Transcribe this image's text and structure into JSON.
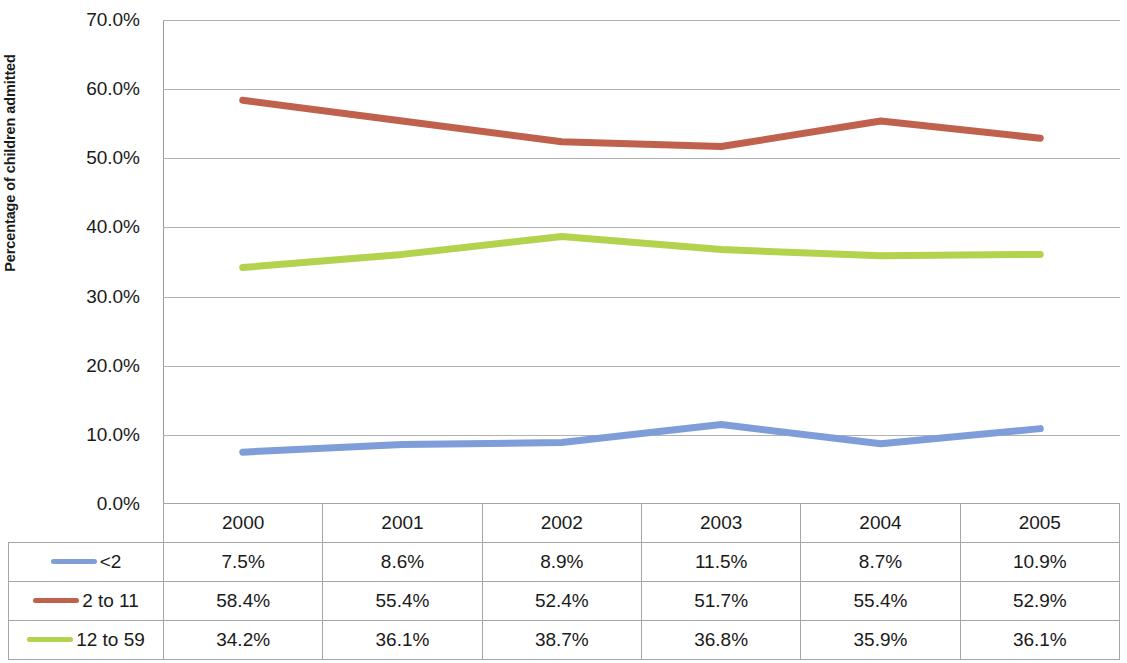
{
  "chart_data": {
    "type": "line",
    "title": "",
    "xlabel": "",
    "ylabel": "Percentage of children admitted",
    "categories": [
      "2000",
      "2001",
      "2002",
      "2003",
      "2004",
      "2005"
    ],
    "ylim": [
      0,
      70
    ],
    "ytick_labels": [
      "70.0%",
      "60.0%",
      "50.0%",
      "40.0%",
      "30.0%",
      "20.0%",
      "10.0%",
      "0.0%"
    ],
    "ytick_values": [
      70,
      60,
      50,
      40,
      30,
      20,
      10,
      0
    ],
    "grid": true,
    "legend_position": "data-table-left",
    "data_table_visible": true,
    "series": [
      {
        "name": "<2",
        "color": "#7f9dd9",
        "values": [
          7.5,
          8.6,
          8.9,
          11.5,
          8.7,
          10.9
        ],
        "labels": [
          "7.5%",
          "8.6%",
          "8.9%",
          "11.5%",
          "8.7%",
          "10.9%"
        ]
      },
      {
        "name": "2 to 11",
        "color": "#c0614e",
        "values": [
          58.4,
          55.4,
          52.4,
          51.7,
          55.4,
          52.9
        ],
        "labels": [
          "58.4%",
          "55.4%",
          "52.4%",
          "51.7%",
          "55.4%",
          "52.9%"
        ]
      },
      {
        "name": "12 to 59",
        "color": "#b3d24e",
        "values": [
          34.2,
          36.1,
          38.7,
          36.8,
          35.9,
          36.1
        ],
        "labels": [
          "34.2%",
          "36.1%",
          "38.7%",
          "36.8%",
          "35.9%",
          "36.1%"
        ]
      }
    ]
  },
  "colors": {
    "gridline": "#b2b2b2",
    "axis": "#8f8f8f",
    "table_border": "#a6a6a6",
    "text": "#1a1a1a"
  }
}
